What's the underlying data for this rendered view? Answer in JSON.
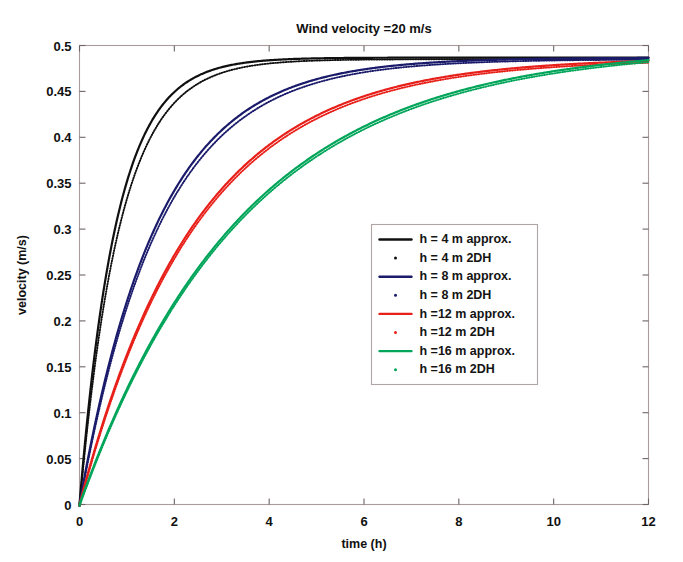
{
  "chart_data": {
    "type": "line",
    "title": "Wind velocity =20 m/s",
    "xlabel": "time (h)",
    "ylabel": "velocity (m/s)",
    "xlim": [
      0,
      12
    ],
    "ylim": [
      0,
      0.5
    ],
    "xticks": [
      0,
      2,
      4,
      6,
      8,
      10,
      12
    ],
    "xtick_labels": [
      "0",
      "2",
      "4",
      "6",
      "8",
      "10",
      "12"
    ],
    "yticks": [
      0,
      0.05,
      0.1,
      0.15,
      0.2,
      0.25,
      0.3,
      0.35,
      0.4,
      0.45,
      0.5
    ],
    "ytick_labels": [
      "0",
      "0.05",
      "0.1",
      "0.15",
      "0.2",
      "0.25",
      "0.3",
      "0.35",
      "0.4",
      "0.45",
      "0.5"
    ],
    "grid": false,
    "legend_position": "center-right",
    "asymptote": 0.485,
    "x": [
      0,
      0.25,
      0.5,
      0.75,
      1,
      1.25,
      1.5,
      1.75,
      2,
      2.5,
      3,
      3.5,
      4,
      4.5,
      5,
      5.5,
      6,
      7,
      8,
      9,
      10,
      11,
      12
    ],
    "series": [
      {
        "name": "h = 4 m approx.",
        "color": "#101010",
        "style": "solid",
        "tau": 0.78,
        "values": [
          0,
          0.131,
          0.224,
          0.29,
          0.338,
          0.372,
          0.397,
          0.415,
          0.428,
          0.445,
          0.457,
          0.466,
          0.472,
          0.476,
          0.479,
          0.481,
          0.482,
          0.484,
          0.485,
          0.485,
          0.485,
          0.485,
          0.485
        ]
      },
      {
        "name": "h = 4 m 2DH",
        "color": "#101010",
        "style": "dotted",
        "tau": 0.86,
        "values": [
          0,
          0.122,
          0.212,
          0.277,
          0.326,
          0.362,
          0.388,
          0.408,
          0.422,
          0.441,
          0.454,
          0.463,
          0.47,
          0.475,
          0.478,
          0.48,
          0.482,
          0.484,
          0.485,
          0.485,
          0.485,
          0.485,
          0.485
        ]
      },
      {
        "name": "h = 8 m approx.",
        "color": "#1b1b6b",
        "style": "solid",
        "tau": 1.65,
        "values": [
          0,
          0.068,
          0.128,
          0.18,
          0.225,
          0.264,
          0.297,
          0.326,
          0.351,
          0.391,
          0.42,
          0.44,
          0.454,
          0.464,
          0.471,
          0.476,
          0.479,
          0.483,
          0.484,
          0.485,
          0.485,
          0.485,
          0.485
        ]
      },
      {
        "name": "h = 8 m 2DH",
        "color": "#1b1b6b",
        "style": "dotted",
        "tau": 1.7,
        "values": [
          0,
          0.066,
          0.125,
          0.176,
          0.22,
          0.259,
          0.292,
          0.321,
          0.347,
          0.387,
          0.417,
          0.438,
          0.452,
          0.462,
          0.47,
          0.475,
          0.478,
          0.482,
          0.484,
          0.485,
          0.485,
          0.485,
          0.485
        ]
      },
      {
        "name": "h =12 m approx.",
        "color": "#e8201a",
        "style": "solid",
        "tau": 2.45,
        "values": [
          0,
          0.047,
          0.09,
          0.13,
          0.166,
          0.199,
          0.229,
          0.256,
          0.281,
          0.324,
          0.359,
          0.387,
          0.409,
          0.427,
          0.44,
          0.451,
          0.459,
          0.47,
          0.477,
          0.481,
          0.483,
          0.484,
          0.485
        ]
      },
      {
        "name": "h =12 m 2DH",
        "color": "#e8201a",
        "style": "dotted",
        "tau": 2.48,
        "values": [
          0,
          0.046,
          0.089,
          0.129,
          0.165,
          0.197,
          0.227,
          0.254,
          0.279,
          0.322,
          0.357,
          0.385,
          0.408,
          0.426,
          0.439,
          0.45,
          0.458,
          0.47,
          0.477,
          0.481,
          0.483,
          0.484,
          0.485
        ]
      },
      {
        "name": "h =16 m approx.",
        "color": "#00a55a",
        "style": "solid",
        "tau": 3.45,
        "values": [
          0,
          0.034,
          0.066,
          0.096,
          0.124,
          0.15,
          0.175,
          0.198,
          0.22,
          0.259,
          0.294,
          0.323,
          0.349,
          0.371,
          0.39,
          0.406,
          0.419,
          0.441,
          0.456,
          0.466,
          0.473,
          0.477,
          0.48
        ]
      },
      {
        "name": "h =16 m 2DH",
        "color": "#00a55a",
        "style": "dotted",
        "tau": 3.48,
        "values": [
          0,
          0.034,
          0.066,
          0.095,
          0.123,
          0.149,
          0.174,
          0.197,
          0.219,
          0.258,
          0.293,
          0.322,
          0.348,
          0.37,
          0.389,
          0.405,
          0.418,
          0.44,
          0.455,
          0.465,
          0.472,
          0.477,
          0.48
        ]
      }
    ]
  },
  "legend": {
    "items": [
      {
        "label": "h = 4 m approx.",
        "marker": "line",
        "color": "#101010"
      },
      {
        "label": "h = 4 m 2DH",
        "marker": "dot",
        "color": "#101010"
      },
      {
        "label": "h = 8 m approx.",
        "marker": "line",
        "color": "#1b1b6b"
      },
      {
        "label": "h = 8 m 2DH",
        "marker": "dot",
        "color": "#1b1b6b"
      },
      {
        "label": "h =12 m approx.",
        "marker": "line",
        "color": "#e8201a"
      },
      {
        "label": "h =12 m 2DH",
        "marker": "dot",
        "color": "#e8201a"
      },
      {
        "label": "h =16 m approx.",
        "marker": "line",
        "color": "#00a55a"
      },
      {
        "label": "h =16 m 2DH",
        "marker": "dot",
        "color": "#00a55a"
      }
    ]
  }
}
